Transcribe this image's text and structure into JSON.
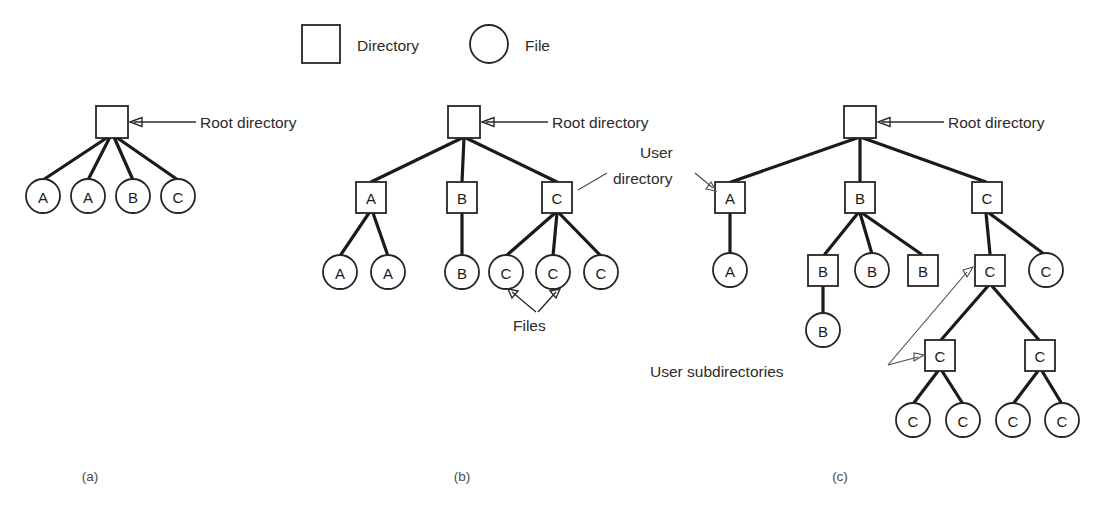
{
  "figure": {
    "legend": [
      {
        "shape": "square",
        "label": "Directory"
      },
      {
        "shape": "circle",
        "label": "File"
      }
    ],
    "annotations": {
      "root_a": "Root directory",
      "root_b": "Root directory",
      "root_c": "Root directory",
      "user_directory_line1": "User",
      "user_directory_line2": "directory",
      "files": "Files",
      "user_subdirectories": "User subdirectories"
    },
    "captions": {
      "a": "(a)",
      "b": "(b)",
      "c": "(c)"
    },
    "colors": {
      "stroke": "#262626",
      "edge": "#1a1a1a",
      "fill": "#ffffff",
      "text": "#1a1a1a",
      "annotation": "#2b2b2b",
      "caption": "#4a4a4a"
    },
    "diagrams": [
      {
        "id": "a",
        "name": "single-level-directory-system",
        "nodes": [
          {
            "id": "a-root",
            "type": "square",
            "label": "",
            "cx": 112,
            "cy": 122
          },
          {
            "id": "a-f1",
            "type": "circle",
            "label": "A",
            "cx": 43,
            "cy": 196
          },
          {
            "id": "a-f2",
            "type": "circle",
            "label": "A",
            "cx": 88,
            "cy": 196
          },
          {
            "id": "a-f3",
            "type": "circle",
            "label": "B",
            "cx": 133,
            "cy": 196
          },
          {
            "id": "a-f4",
            "type": "circle",
            "label": "C",
            "cx": 178,
            "cy": 196
          }
        ],
        "edges": [
          [
            "a-root",
            "a-f1"
          ],
          [
            "a-root",
            "a-f2"
          ],
          [
            "a-root",
            "a-f3"
          ],
          [
            "a-root",
            "a-f4"
          ]
        ]
      },
      {
        "id": "b",
        "name": "two-level-directory-system",
        "nodes": [
          {
            "id": "b-root",
            "type": "square",
            "label": "",
            "cx": 464,
            "cy": 122
          },
          {
            "id": "b-A",
            "type": "square",
            "label": "A",
            "cx": 371,
            "cy": 197
          },
          {
            "id": "b-B",
            "type": "square",
            "label": "B",
            "cx": 462,
            "cy": 197
          },
          {
            "id": "b-C",
            "type": "square",
            "label": "C",
            "cx": 557,
            "cy": 197
          },
          {
            "id": "b-a1",
            "type": "circle",
            "label": "A",
            "cx": 340,
            "cy": 272
          },
          {
            "id": "b-a2",
            "type": "circle",
            "label": "A",
            "cx": 388,
            "cy": 272
          },
          {
            "id": "b-b1",
            "type": "circle",
            "label": "B",
            "cx": 462,
            "cy": 272
          },
          {
            "id": "b-c1",
            "type": "circle",
            "label": "C",
            "cx": 506,
            "cy": 272
          },
          {
            "id": "b-c2",
            "type": "circle",
            "label": "C",
            "cx": 553,
            "cy": 272
          },
          {
            "id": "b-c3",
            "type": "circle",
            "label": "C",
            "cx": 601,
            "cy": 272
          }
        ],
        "edges": [
          [
            "b-root",
            "b-A"
          ],
          [
            "b-root",
            "b-B"
          ],
          [
            "b-root",
            "b-C"
          ],
          [
            "b-A",
            "b-a1"
          ],
          [
            "b-A",
            "b-a2"
          ],
          [
            "b-B",
            "b-b1"
          ],
          [
            "b-C",
            "b-c1"
          ],
          [
            "b-C",
            "b-c2"
          ],
          [
            "b-C",
            "b-c3"
          ]
        ]
      },
      {
        "id": "c",
        "name": "hierarchical-directory-system",
        "nodes": [
          {
            "id": "c-root",
            "type": "square",
            "label": "",
            "cx": 860,
            "cy": 122
          },
          {
            "id": "c-A",
            "type": "square",
            "label": "A",
            "cx": 730,
            "cy": 197
          },
          {
            "id": "c-B",
            "type": "square",
            "label": "B",
            "cx": 860,
            "cy": 197
          },
          {
            "id": "c-C",
            "type": "square",
            "label": "C",
            "cx": 987,
            "cy": 197
          },
          {
            "id": "c-a1",
            "type": "circle",
            "label": "A",
            "cx": 730,
            "cy": 270
          },
          {
            "id": "c-b1",
            "type": "square",
            "label": "B",
            "cx": 823,
            "cy": 270
          },
          {
            "id": "c-b2",
            "type": "circle",
            "label": "B",
            "cx": 872,
            "cy": 270
          },
          {
            "id": "c-b3",
            "type": "square",
            "label": "B",
            "cx": 923,
            "cy": 270
          },
          {
            "id": "c-c1",
            "type": "square",
            "label": "C",
            "cx": 990,
            "cy": 270
          },
          {
            "id": "c-c2",
            "type": "circle",
            "label": "C",
            "cx": 1046,
            "cy": 270
          },
          {
            "id": "c-b1a",
            "type": "circle",
            "label": "B",
            "cx": 823,
            "cy": 330
          },
          {
            "id": "c-c1a",
            "type": "square",
            "label": "C",
            "cx": 940,
            "cy": 355
          },
          {
            "id": "c-c1b",
            "type": "square",
            "label": "C",
            "cx": 1040,
            "cy": 355
          },
          {
            "id": "c-c1a1",
            "type": "circle",
            "label": "C",
            "cx": 913,
            "cy": 420
          },
          {
            "id": "c-c1a2",
            "type": "circle",
            "label": "C",
            "cx": 963,
            "cy": 420
          },
          {
            "id": "c-c1b1",
            "type": "circle",
            "label": "C",
            "cx": 1013,
            "cy": 420
          },
          {
            "id": "c-c1b2",
            "type": "circle",
            "label": "C",
            "cx": 1062,
            "cy": 420
          }
        ],
        "edges": [
          [
            "c-root",
            "c-A"
          ],
          [
            "c-root",
            "c-B"
          ],
          [
            "c-root",
            "c-C"
          ],
          [
            "c-A",
            "c-a1"
          ],
          [
            "c-B",
            "c-b1"
          ],
          [
            "c-B",
            "c-b2"
          ],
          [
            "c-B",
            "c-b3"
          ],
          [
            "c-b1",
            "c-b1a"
          ],
          [
            "c-C",
            "c-c1"
          ],
          [
            "c-C",
            "c-c2"
          ],
          [
            "c-c1",
            "c-c1a"
          ],
          [
            "c-c1",
            "c-c1b"
          ],
          [
            "c-c1a",
            "c-c1a1"
          ],
          [
            "c-c1a",
            "c-c1a2"
          ],
          [
            "c-c1b",
            "c-c1b1"
          ],
          [
            "c-c1b",
            "c-c1b2"
          ]
        ]
      }
    ]
  }
}
